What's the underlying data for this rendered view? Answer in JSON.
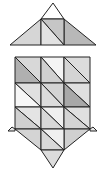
{
  "diagram": {
    "stroke_color": "#222222",
    "top": {
      "apex_fill": "#ffffff",
      "left_fill": "#d6d6d6",
      "square_upper_fill": "#c6c6c6",
      "square_lower_fill": "#e2e2e2",
      "right_fill": "#b8b8b8"
    },
    "grid": {
      "rows": 3,
      "cols": 3,
      "cells": [
        [
          {
            "upper": "#d8d8d8",
            "lower": "#b0b0b0"
          },
          {
            "upper": "#f4f4f4",
            "lower": "#d0d0d0"
          },
          {
            "upper": "#dcdcdc",
            "lower": "#d4d4d4"
          }
        ],
        [
          {
            "upper": "#e0e0e0",
            "lower": "#f6f6f6"
          },
          {
            "upper": "#d4d4d4",
            "lower": "#dcdcdc"
          },
          {
            "upper": "#e0e0e0",
            "lower": "#a8a8a8"
          }
        ],
        [
          {
            "upper": "#e4e4e4",
            "lower": "#d0d0d0"
          },
          {
            "upper": "#f0f0f0",
            "lower": "#d8d8d8"
          },
          {
            "upper": "#e0e0e0",
            "lower": "#d4d4d4"
          }
        ]
      ]
    },
    "bottom": {
      "left_fill": "#d4d4d4",
      "square_upper_fill": "#f0f0f0",
      "square_lower_fill": "#d8d8d8",
      "right_fill": "#d0d0d0",
      "tip_fill": "#dcdcdc",
      "wing_fill": "#e8e8e8"
    }
  }
}
